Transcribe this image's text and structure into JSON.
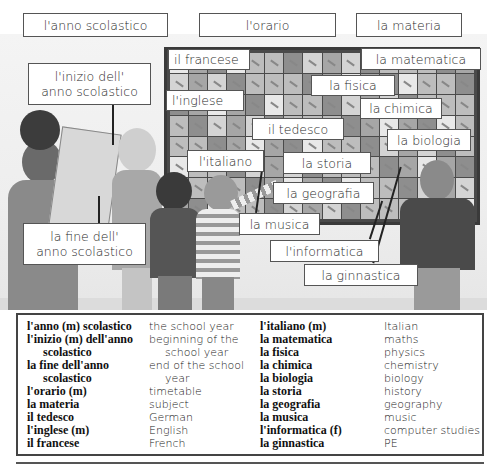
{
  "header_labels": {
    "school_year": "l'anno scolastico",
    "timetable": "l'orario",
    "subject": "la materia"
  },
  "scene_labels": {
    "start_of_year_line1": "l'inizio dell'",
    "start_of_year_line2": "anno scolastico",
    "end_of_year_line1": "la fine dell'",
    "end_of_year_line2": "anno scolastico",
    "french": "il francese",
    "maths": "la matematica",
    "physics": "la fisica",
    "english": "l'inglese",
    "chemistry": "la chimica",
    "german": "il tedesco",
    "biology": "la biologia",
    "italian": "l'italiano",
    "history": "la storia",
    "geography": "la geografia",
    "music": "la musica",
    "computer_studies": "l'informatica",
    "pe": "la ginnastica"
  },
  "vocabulary": {
    "left": [
      {
        "it": "l'anno (m) scolastico",
        "en": "the school year"
      },
      {
        "it": "l'inizio (m) dell'anno",
        "en": "beginning of the"
      },
      {
        "it": "scolastico",
        "en": "school year",
        "indent": true
      },
      {
        "it": "la fine dell'anno",
        "en": "end of the school"
      },
      {
        "it": "scolastico",
        "en": "year",
        "indent": true
      },
      {
        "it": "l'orario (m)",
        "en": "timetable"
      },
      {
        "it": "la materia",
        "en": "subject"
      },
      {
        "it": "il tedesco",
        "en": "German"
      },
      {
        "it": "l'inglese (m)",
        "en": "English"
      },
      {
        "it": "il francese",
        "en": "French"
      }
    ],
    "right": [
      {
        "it": "l'italiano (m)",
        "en": "Italian"
      },
      {
        "it": "la matematica",
        "en": "maths"
      },
      {
        "it": "la fisica",
        "en": "physics"
      },
      {
        "it": "la chimica",
        "en": "chemistry"
      },
      {
        "it": "la biologia",
        "en": "biology"
      },
      {
        "it": "la storia",
        "en": "history"
      },
      {
        "it": "la geografia",
        "en": "geography"
      },
      {
        "it": "la musica",
        "en": "music"
      },
      {
        "it": "l'informatica (f)",
        "en": "computer studies"
      },
      {
        "it": "la ginnastica",
        "en": "PE"
      }
    ]
  }
}
